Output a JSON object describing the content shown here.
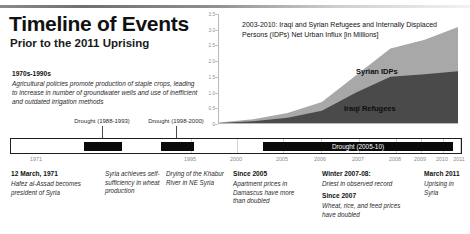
{
  "header": {
    "title": "Timeline of Events",
    "subtitle": "Prior to the 2011 Uprising"
  },
  "early_note": {
    "heading": "1970s-1990s",
    "body": "Agricultural policies promote production of staple crops, leading to increase in number of groundwater wells and use of inefficient and outdated irrigation methods"
  },
  "chart_data": {
    "type": "area",
    "title": "2003-2010: Iraqi and Syrian Refugees and Internally Displaced Persons (IDPs) Net Urban Influx [in Millions]",
    "xlabel": "",
    "ylabel": "Millions",
    "ylim": [
      0,
      3.5
    ],
    "yticks": [
      "3.5",
      "3.0",
      "2.5",
      "2.0",
      "1.5",
      "1.0",
      "0.5",
      "0"
    ],
    "grid": false,
    "legend_position": "inline-labels",
    "x": [
      2003,
      2004,
      2005,
      2006,
      2007,
      2008,
      2009,
      2010
    ],
    "series": [
      {
        "name": "Iraqi Refugees",
        "color": "#4a4a4a",
        "values": [
          0.03,
          0.09,
          0.2,
          0.42,
          1.0,
          1.5,
          1.58,
          1.68
        ]
      },
      {
        "name": "Syrian IDPs",
        "color": "#a8a8a8",
        "values": [
          0.02,
          0.06,
          0.15,
          0.28,
          0.55,
          0.9,
          1.1,
          1.42
        ]
      }
    ]
  },
  "timeline": {
    "years": [
      "1971",
      "1995",
      "2000",
      "2005",
      "2006",
      "2007",
      "2008",
      "2009",
      "2010",
      "2011"
    ],
    "droughts": [
      {
        "label": "Drought (1988-1993)",
        "bar_text": ""
      },
      {
        "label": "Drought (1998-2000)",
        "bar_text": ""
      },
      {
        "label": "",
        "bar_text": "Drought (2005-10)"
      }
    ]
  },
  "annotations": [
    {
      "heading": "12 March, 1971",
      "body": "Hafez al-Assad becomes president of Syria"
    },
    {
      "heading": "",
      "body": "Syria achieves self-sufficiency in wheat production"
    },
    {
      "heading": "",
      "body": "Drying of the Khabur River in NE Syria"
    },
    {
      "heading": "Since 2005",
      "body": "Apartment prices in Damascus have more than doubled"
    },
    {
      "heading": "Winter 2007-08:",
      "body": "Driest in observed record"
    },
    {
      "heading": "Since 2007",
      "body": "Wheat, rice, and feed prices have doubled"
    },
    {
      "heading": "March 2011",
      "body": "Uprising in Syria"
    }
  ]
}
